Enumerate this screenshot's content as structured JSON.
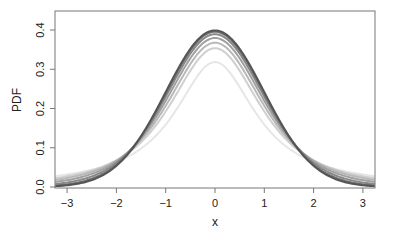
{
  "chart_data": {
    "type": "line",
    "title": "",
    "xlabel": "x",
    "ylabel": "PDF",
    "xlim": [
      -3.24,
      3.24
    ],
    "ylim": [
      0,
      0.44
    ],
    "xticks": [
      -3,
      -2,
      -1,
      0,
      1,
      2,
      3
    ],
    "xtick_labels": [
      "−3",
      "−2",
      "−1",
      "0",
      "1",
      "2",
      "3"
    ],
    "yticks": [
      0.0,
      0.1,
      0.2,
      0.3,
      0.4
    ],
    "ytick_labels": [
      "0.0",
      "0.1",
      "0.2",
      "0.3",
      "0.4"
    ],
    "grid": false,
    "legend": null,
    "series": [
      {
        "name": "t, df=1",
        "df": 1,
        "peak": 0.318,
        "color": "#e6e6e6"
      },
      {
        "name": "t, df=2",
        "df": 2,
        "peak": 0.354,
        "color": "#cfcfcf"
      },
      {
        "name": "t, df=3",
        "df": 3,
        "peak": 0.368,
        "color": "#b8b8b8"
      },
      {
        "name": "t, df=5",
        "df": 5,
        "peak": 0.38,
        "color": "#a0a0a0"
      },
      {
        "name": "t, df=10",
        "df": 10,
        "peak": 0.389,
        "color": "#888888"
      },
      {
        "name": "t, df=30",
        "df": 30,
        "peak": 0.396,
        "color": "#707070"
      },
      {
        "name": "normal",
        "df": null,
        "peak": 0.399,
        "color": "#555555"
      }
    ]
  }
}
